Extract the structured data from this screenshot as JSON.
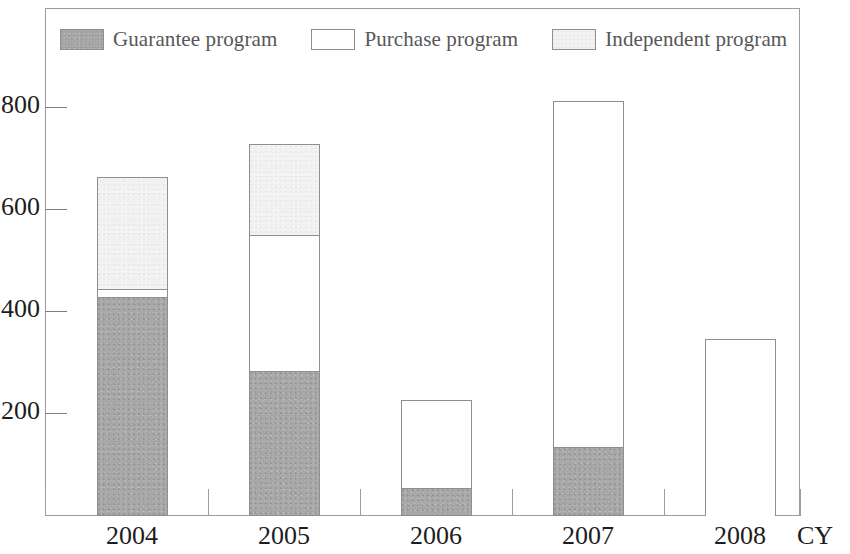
{
  "chart_data": {
    "type": "bar",
    "subtype": "stacked-vertical",
    "title": "",
    "subtitle": "",
    "xlabel": "CY",
    "ylabel": "",
    "categories": [
      "2004",
      "2005",
      "2006",
      "2007",
      "2008"
    ],
    "series": [
      {
        "name": "Guarantee program",
        "values": [
          430,
          285,
          55,
          135,
          0
        ],
        "color": "#a9a9a9"
      },
      {
        "name": "Purchase program",
        "values": [
          15,
          267,
          173,
          678,
          348
        ],
        "color": "#ffffff"
      },
      {
        "name": "Independent program",
        "values": [
          220,
          178,
          0,
          0,
          0
        ],
        "color": "#f3f3f3"
      }
    ],
    "totals": [
      665,
      730,
      228,
      813,
      348
    ],
    "ylim": [
      0,
      900
    ],
    "yticks": [
      200,
      400,
      600,
      800
    ],
    "ytick_labels": [
      "200",
      "400",
      "600",
      "800"
    ],
    "grid": false,
    "legend_position": "top-inside"
  },
  "legend": {
    "items": [
      {
        "label": "Guarantee program",
        "swatch": "guarantee"
      },
      {
        "label": "Purchase program",
        "swatch": "purchase"
      },
      {
        "label": "Independent program",
        "swatch": "independent"
      }
    ]
  },
  "axes": {
    "y_tick_labels": [
      "800",
      "600",
      "400",
      "200"
    ],
    "x_tick_labels": [
      "2004",
      "2005",
      "2006",
      "2007",
      "2008"
    ],
    "x_axis_name": "CY"
  }
}
